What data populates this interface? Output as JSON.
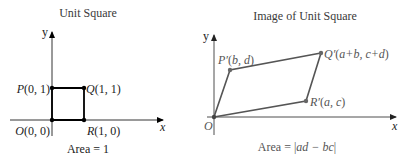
{
  "left_panel": {
    "title": "Unit Square",
    "axis_x_label": "x",
    "axis_y_label": "y",
    "points": {
      "O": {
        "letter": "O",
        "coords": "(0, 0)"
      },
      "P": {
        "letter": "P",
        "coords": "(0, 1)"
      },
      "Q": {
        "letter": "Q",
        "coords": "(1, 1)"
      },
      "R": {
        "letter": "R",
        "coords": "(1, 0)"
      }
    },
    "area_label": "Area = 1",
    "line_color": "#000000"
  },
  "right_panel": {
    "title": "Image of Unit Square",
    "axis_x_label": "x",
    "axis_y_label": "y",
    "points": {
      "O": {
        "letter": "O"
      },
      "P": {
        "letter": "P′",
        "coords_open": "(",
        "coords_vars": "b, d",
        "coords_close": ")"
      },
      "Q": {
        "letter": "Q′",
        "coords_open": "(",
        "coords_vars": "a+b, c+d",
        "coords_close": ")"
      },
      "R": {
        "letter": "R′",
        "coords_open": "(",
        "coords_vars": "a, c",
        "coords_close": ")"
      }
    },
    "area_prefix": "Area = |",
    "area_expr": "ad − bc",
    "area_suffix": "|",
    "line_color": "#555555"
  }
}
